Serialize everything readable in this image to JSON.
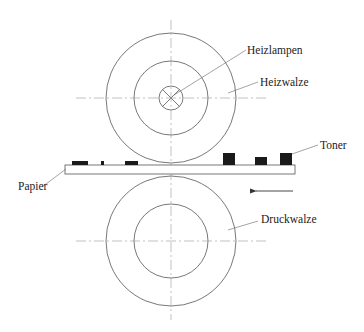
{
  "diagram": {
    "type": "fuser-unit-schematic",
    "colors": {
      "stroke": "#555555",
      "toner": "#1a1a1a",
      "background": "#ffffff"
    },
    "labels": {
      "heizlampen": "Heizlampen",
      "heizwalze": "Heizwalze",
      "toner": "Toner",
      "papier": "Papier",
      "druckwalze": "Druckwalze"
    },
    "heizwalze": {
      "cx": 171,
      "cy": 98,
      "r_outer": 65,
      "r_inner": 37,
      "lamp_r": 12
    },
    "druckwalze": {
      "cx": 171,
      "cy": 241,
      "r_outer": 65,
      "r_inner": 37
    },
    "paper": {
      "x": 65,
      "y": 165,
      "width": 230,
      "height": 9
    },
    "toner_particles": [
      {
        "x": 72,
        "y": 161,
        "w": 16,
        "h": 4
      },
      {
        "x": 101,
        "y": 161,
        "w": 3,
        "h": 4
      },
      {
        "x": 125,
        "y": 161,
        "w": 13,
        "h": 4
      },
      {
        "x": 223,
        "y": 153,
        "w": 12,
        "h": 12
      },
      {
        "x": 255,
        "y": 157,
        "w": 12,
        "h": 8
      },
      {
        "x": 280,
        "y": 153,
        "w": 12,
        "h": 12
      }
    ],
    "feed_direction_arrow": {
      "x1": 293,
      "x2": 250,
      "y": 191,
      "direction": "left"
    }
  }
}
